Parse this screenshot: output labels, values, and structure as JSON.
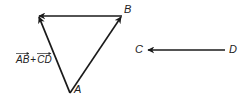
{
  "diagram": {
    "type": "vector-addition",
    "colors": {
      "stroke": "#1a1a1a",
      "text": "#222222",
      "background": "#ffffff"
    },
    "points": {
      "A": {
        "label": "A",
        "x": 70,
        "y": 93
      },
      "B": {
        "label": "B",
        "x": 122,
        "y": 16
      },
      "S": {
        "label": "",
        "x": 38,
        "y": 16
      },
      "C": {
        "label": "C",
        "x": 147,
        "y": 50
      },
      "D": {
        "label": "D",
        "x": 225,
        "y": 50
      }
    },
    "vectors": [
      {
        "name": "AB",
        "from": "A",
        "to": "B"
      },
      {
        "name": "BS (equal to CD)",
        "from": "B",
        "to": "S"
      },
      {
        "name": "AB + CD",
        "from": "A",
        "to": "S"
      },
      {
        "name": "CD",
        "from": "D",
        "to": "C"
      }
    ],
    "labels": {
      "A": "A",
      "B": "B",
      "C": "C",
      "D": "D",
      "sum_left": "AB",
      "sum_plus": "+",
      "sum_right": "CD"
    }
  }
}
